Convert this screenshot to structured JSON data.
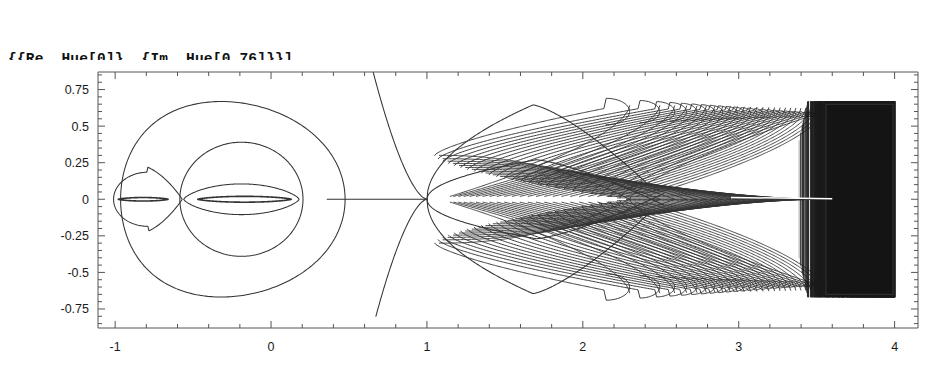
{
  "code": {
    "lines": [
      "{{Re, Hue[0]}, {Im, Hue[0.76]}}],",
      "PlotRange -> All, AspectRatio -> Automatic]]]"
    ],
    "line1": "{{Re, Hue[0]}, {Im, Hue[0.76]}}],",
    "line2": "PlotRange -> All, AspectRatio -> Automatic]]]"
  },
  "chart_data": {
    "type": "line",
    "title": "",
    "xlabel": "",
    "ylabel": "",
    "xlim": [
      -1.11,
      4.15
    ],
    "ylim": [
      -0.88,
      0.87
    ],
    "grid": false,
    "legend": null,
    "frame": true,
    "line_color": "#333333",
    "background": "#ffffff",
    "xticks": [
      -1,
      0,
      1,
      2,
      3,
      4
    ],
    "xtick_labels": [
      "-1",
      "0",
      "1",
      "2",
      "3",
      "4"
    ],
    "xminor_step": 0.2,
    "yticks": [
      0.75,
      0.5,
      0.25,
      0,
      -0.25,
      -0.5,
      -0.75
    ],
    "ytick_labels": [
      "0.75",
      "0.5",
      "0.25",
      "0",
      "-0.25",
      "-0.5",
      "-0.75"
    ],
    "yminor_step": 0.05,
    "features": [
      {
        "name": "small-oval",
        "center_x": -0.79,
        "half_width": 0.22,
        "half_height": 0.185
      },
      {
        "name": "inner-lens-small",
        "center_x": -0.82,
        "half_width": 0.16,
        "half_height": 0.012
      },
      {
        "name": "large-oval",
        "center_x": -0.245,
        "half_width": 0.72,
        "half_height": 0.665
      },
      {
        "name": "mid-oval",
        "center_x": -0.19,
        "half_width": 0.395,
        "half_height": 0.39
      },
      {
        "name": "inner-lens-mid",
        "center_x": -0.19,
        "half_width": 0.37,
        "half_height": 0.105
      },
      {
        "name": "thin-lens-mid",
        "center_x": -0.17,
        "half_width": 0.3,
        "half_height": 0.02
      },
      {
        "name": "horizontal-segment",
        "x_start": 0.36,
        "x_end": 1.0,
        "y": 0.0
      },
      {
        "name": "branch-crossing",
        "x": 1.0,
        "y": 0.0,
        "branches": 6
      },
      {
        "name": "vertical-branch",
        "x_at_y0": 0.74,
        "y_top": 0.87,
        "y_bottom": -0.8
      },
      {
        "name": "outer-lobe",
        "peak_x": 1.68,
        "peak_y": 0.645
      },
      {
        "name": "inner-lobe",
        "peak_x": 1.7,
        "peak_y": 0.27
      },
      {
        "name": "hairpin-fan",
        "x_start": 2.3,
        "x_end": 3.55,
        "loops": 26,
        "amplitude": 0.62
      },
      {
        "name": "dense-black-band",
        "x_start": 3.38,
        "x_end": 4.0,
        "y_top": 0.67,
        "y_bottom": -0.67
      }
    ],
    "series": [
      {
        "name": "Re",
        "color_spec": "Hue[0]",
        "values_note": "real part level curves"
      },
      {
        "name": "Im",
        "color_spec": "Hue[0.76]",
        "values_note": "imaginary part level curves"
      }
    ]
  }
}
